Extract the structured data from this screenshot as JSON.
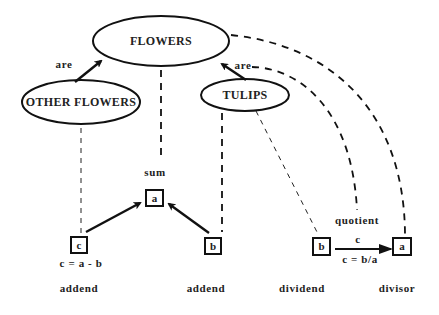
{
  "nodes": {
    "flowers": {
      "label": "FLOWERS"
    },
    "other_flowers": {
      "label": "OTHER FLOWERS"
    },
    "tulips": {
      "label": "TULIPS"
    }
  },
  "relations": {
    "other_are": "are",
    "tulips_are": "are"
  },
  "boxes": {
    "sum_box": "a",
    "addend_c_box": "c",
    "addend_b_box": "b",
    "dividend_box": "b",
    "divisor_box": "a"
  },
  "labels": {
    "sum": "sum",
    "subtraction_formula": "c = a - b",
    "quotient": "quotient",
    "quotient_arrow_var": "c",
    "division_formula": "c = b/a"
  },
  "roles": {
    "addend_left": "addend",
    "addend_right": "addend",
    "dividend": "dividend",
    "divisor": "divisor"
  }
}
